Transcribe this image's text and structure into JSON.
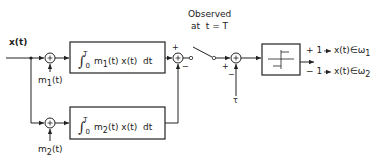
{
  "diagram": {
    "input": {
      "label": "x(t)"
    },
    "branch_top": {
      "sum_node_label": "+",
      "reference_label": "m1(t)",
      "reference_main": "m",
      "reference_sub": "1",
      "reference_arg": "(t)",
      "correlator": {
        "integral": "∫",
        "upper": "T",
        "lower": "0",
        "expr": "m",
        "expr_sub": "1",
        "expr_rest": "(t) x(t)  dt",
        "full": "∫_0^T m1(t) x(t) dt"
      }
    },
    "branch_bottom": {
      "sum_node_label": "+",
      "reference_label": "m2(t)",
      "reference_main": "m",
      "reference_sub": "2",
      "reference_arg": "(t)",
      "correlator": {
        "integral": "∫",
        "upper": "T",
        "lower": "0",
        "expr": "m",
        "expr_sub": "2",
        "expr_rest": "(t) x(t)  dt",
        "full": "∫_0^T m2(t) x(t) dt"
      }
    },
    "difference_node": {
      "plus_sign": "+",
      "minus_sign": "−"
    },
    "sampler": {
      "label_line1": "Observed",
      "label_line2": "at  t = T"
    },
    "threshold_node": {
      "plus_sign": "+",
      "minus_sign": "−",
      "threshold_label": "τ"
    },
    "decision": {
      "block": "hard-limiter",
      "outputs": [
        {
          "value": "+ 1",
          "arrow": "→",
          "result": "x(t)∈ω",
          "class_sub": "1"
        },
        {
          "value": "− 1",
          "arrow": "→",
          "result": "x(t)∈ω",
          "class_sub": "2"
        }
      ]
    },
    "colors": {
      "stroke": "#222222",
      "background": "#ffffff"
    }
  }
}
